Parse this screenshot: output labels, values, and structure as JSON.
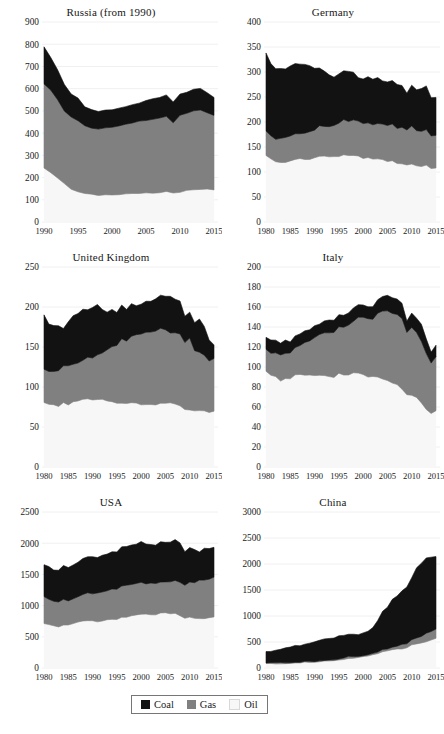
{
  "figure": {
    "type": "small-multiples",
    "panel_count": 6,
    "series_names": [
      "Coal",
      "Gas",
      "Oil"
    ],
    "colors": {
      "coal": "#121212",
      "gas": "#808080",
      "oil": "#f7f7f7",
      "axis": "#191919",
      "grid": "#f0f0f0"
    }
  },
  "legend": {
    "name": "chart-legend",
    "items": [
      {
        "label": "Coal",
        "color": "#121212"
      },
      {
        "label": "Gas",
        "color": "#808080"
      },
      {
        "label": "Oil",
        "color": "#f7f7f7"
      }
    ]
  },
  "chart_data": [
    {
      "type": "area",
      "stacked": true,
      "title": "Russia (from 1990)",
      "xlabel": "",
      "ylabel": "",
      "xlim": [
        1990,
        2015
      ],
      "ylim": [
        0,
        900
      ],
      "yticks": [
        0,
        100,
        200,
        300,
        400,
        500,
        600,
        700,
        800,
        900
      ],
      "xticks": [
        1990,
        1995,
        2000,
        2005,
        2010,
        2015
      ],
      "grid": true,
      "legend_position": "figure-bottom",
      "x": [
        1990,
        1991,
        1992,
        1993,
        1994,
        1995,
        1996,
        1997,
        1998,
        1999,
        2000,
        2001,
        2002,
        2003,
        2004,
        2005,
        2006,
        2007,
        2008,
        2009,
        2010,
        2011,
        2012,
        2013,
        2014,
        2015
      ],
      "series": [
        {
          "name": "Oil",
          "values": [
            240,
            224,
            200,
            170,
            150,
            138,
            128,
            124,
            120,
            122,
            123,
            124,
            126,
            128,
            130,
            131,
            132,
            134,
            135,
            130,
            136,
            140,
            144,
            146,
            146,
            143
          ]
        },
        {
          "name": "Gas",
          "values": [
            382,
            368,
            352,
            330,
            322,
            318,
            304,
            300,
            298,
            300,
            304,
            306,
            312,
            318,
            322,
            328,
            332,
            336,
            340,
            318,
            346,
            352,
            356,
            356,
            344,
            336
          ]
        },
        {
          "name": "Coal",
          "values": [
            170,
            152,
            136,
            120,
            108,
            100,
            90,
            84,
            80,
            80,
            82,
            84,
            84,
            86,
            88,
            90,
            92,
            92,
            96,
            88,
            92,
            94,
            96,
            98,
            92,
            86
          ]
        }
      ],
      "totals_note": "top of stack ~790 in 1990 falling to ~565 by 2015"
    },
    {
      "type": "area",
      "stacked": true,
      "title": "Germany",
      "xlabel": "",
      "ylabel": "",
      "xlim": [
        1980,
        2015
      ],
      "ylim": [
        0,
        400
      ],
      "yticks": [
        0,
        50,
        100,
        150,
        200,
        250,
        300,
        350,
        400
      ],
      "xticks": [
        1980,
        1985,
        1990,
        1995,
        2000,
        2005,
        2010,
        2015
      ],
      "grid": true,
      "legend_position": "figure-bottom",
      "x": [
        1980,
        1981,
        1982,
        1983,
        1984,
        1985,
        1986,
        1987,
        1988,
        1989,
        1990,
        1991,
        1992,
        1993,
        1994,
        1995,
        1996,
        1997,
        1998,
        1999,
        2000,
        2001,
        2002,
        2003,
        2004,
        2005,
        2006,
        2007,
        2008,
        2009,
        2010,
        2011,
        2012,
        2013,
        2014,
        2015
      ],
      "series": [
        {
          "name": "Oil",
          "values": [
            134,
            126,
            120,
            120,
            120,
            122,
            126,
            126,
            126,
            126,
            128,
            132,
            132,
            130,
            130,
            132,
            134,
            132,
            134,
            132,
            128,
            128,
            126,
            126,
            124,
            122,
            122,
            116,
            116,
            114,
            116,
            112,
            112,
            114,
            108,
            108
          ]
        },
        {
          "name": "Gas",
          "values": [
            48,
            46,
            46,
            47,
            48,
            50,
            50,
            50,
            52,
            54,
            56,
            60,
            58,
            60,
            62,
            66,
            70,
            68,
            70,
            70,
            68,
            70,
            68,
            72,
            72,
            72,
            74,
            72,
            74,
            70,
            76,
            70,
            70,
            72,
            64,
            66
          ]
        },
        {
          "name": "Coal",
          "values": [
            158,
            146,
            140,
            140,
            140,
            142,
            140,
            138,
            136,
            132,
            124,
            116,
            110,
            104,
            100,
            98,
            100,
            100,
            94,
            88,
            90,
            92,
            90,
            90,
            88,
            86,
            88,
            88,
            84,
            76,
            82,
            82,
            86,
            86,
            78,
            76
          ]
        }
      ],
      "totals_note": "~340 in 1980 declining to ~250 by 2015"
    },
    {
      "type": "area",
      "stacked": true,
      "title": "United Kingdom",
      "xlabel": "",
      "ylabel": "",
      "xlim": [
        1980,
        2015
      ],
      "ylim": [
        0,
        250
      ],
      "yticks": [
        0,
        50,
        100,
        150,
        200,
        250
      ],
      "xticks": [
        1980,
        1985,
        1990,
        1995,
        2000,
        2005,
        2010,
        2015
      ],
      "grid": true,
      "legend_position": "figure-bottom",
      "x": [
        1980,
        1981,
        1982,
        1983,
        1984,
        1985,
        1986,
        1987,
        1988,
        1989,
        1990,
        1991,
        1992,
        1993,
        1994,
        1995,
        1996,
        1997,
        1998,
        1999,
        2000,
        2001,
        2002,
        2003,
        2004,
        2005,
        2006,
        2007,
        2008,
        2009,
        2010,
        2011,
        2012,
        2013,
        2014,
        2015
      ],
      "series": [
        {
          "name": "Oil",
          "values": [
            80,
            78,
            78,
            76,
            80,
            78,
            82,
            82,
            84,
            86,
            84,
            84,
            84,
            82,
            82,
            80,
            80,
            80,
            80,
            80,
            78,
            78,
            78,
            78,
            80,
            80,
            80,
            78,
            76,
            72,
            72,
            70,
            70,
            70,
            68,
            70
          ]
        },
        {
          "name": "Gas",
          "values": [
            42,
            42,
            42,
            44,
            46,
            48,
            46,
            48,
            50,
            52,
            52,
            56,
            58,
            64,
            68,
            72,
            80,
            78,
            84,
            86,
            88,
            90,
            90,
            92,
            94,
            92,
            88,
            90,
            90,
            84,
            90,
            76,
            74,
            70,
            64,
            66
          ]
        },
        {
          "name": "Coal",
          "values": [
            68,
            60,
            58,
            58,
            48,
            54,
            62,
            62,
            62,
            60,
            64,
            62,
            56,
            48,
            46,
            42,
            42,
            40,
            40,
            36,
            38,
            40,
            38,
            40,
            40,
            42,
            44,
            42,
            40,
            32,
            32,
            34,
            42,
            36,
            28,
            18
          ]
        }
      ],
      "totals_note": "peak ~205 around 2000-2005, falling to ~150 by 2015"
    },
    {
      "type": "area",
      "stacked": true,
      "title": "Italy",
      "xlabel": "",
      "ylabel": "",
      "xlim": [
        1980,
        2015
      ],
      "ylim": [
        0,
        200
      ],
      "yticks": [
        0,
        20,
        40,
        60,
        80,
        100,
        120,
        140,
        160,
        180,
        200
      ],
      "xticks": [
        1980,
        1985,
        1990,
        1995,
        2000,
        2005,
        2010,
        2015
      ],
      "grid": true,
      "legend_position": "figure-bottom",
      "x": [
        1980,
        1981,
        1982,
        1983,
        1984,
        1985,
        1986,
        1987,
        1988,
        1989,
        1990,
        1991,
        1992,
        1993,
        1994,
        1995,
        1996,
        1997,
        1998,
        1999,
        2000,
        2001,
        2002,
        2003,
        2004,
        2005,
        2006,
        2007,
        2008,
        2009,
        2010,
        2011,
        2012,
        2013,
        2014,
        2015
      ],
      "series": [
        {
          "name": "Oil",
          "values": [
            96,
            92,
            90,
            86,
            88,
            88,
            92,
            92,
            92,
            92,
            92,
            92,
            92,
            90,
            90,
            94,
            92,
            92,
            94,
            94,
            92,
            90,
            90,
            90,
            88,
            86,
            84,
            82,
            78,
            72,
            72,
            70,
            64,
            58,
            54,
            56
          ]
        },
        {
          "name": "Gas",
          "values": [
            22,
            22,
            24,
            26,
            26,
            26,
            28,
            30,
            32,
            34,
            38,
            40,
            42,
            44,
            44,
            46,
            48,
            50,
            52,
            56,
            58,
            58,
            58,
            64,
            68,
            70,
            70,
            70,
            70,
            62,
            68,
            64,
            62,
            56,
            50,
            54
          ]
        },
        {
          "name": "Coal",
          "values": [
            12,
            12,
            12,
            12,
            12,
            12,
            12,
            12,
            12,
            12,
            12,
            12,
            12,
            12,
            12,
            12,
            12,
            12,
            12,
            12,
            12,
            12,
            12,
            14,
            14,
            16,
            16,
            16,
            16,
            12,
            14,
            14,
            16,
            14,
            12,
            12
          ]
        }
      ],
      "totals_note": "peak ~172 around 2005, dropping to ~120 by 2015"
    },
    {
      "type": "area",
      "stacked": true,
      "title": "USA",
      "xlabel": "",
      "ylabel": "",
      "xlim": [
        1980,
        2015
      ],
      "ylim": [
        0,
        2500
      ],
      "yticks": [
        0,
        500,
        1000,
        1500,
        2000,
        2500
      ],
      "xticks": [
        1980,
        1985,
        1990,
        1995,
        2000,
        2005,
        2010,
        2015
      ],
      "grid": true,
      "legend_position": "figure-bottom",
      "x": [
        1980,
        1981,
        1982,
        1983,
        1984,
        1985,
        1986,
        1987,
        1988,
        1989,
        1990,
        1991,
        1992,
        1993,
        1994,
        1995,
        1996,
        1997,
        1998,
        1999,
        2000,
        2001,
        2002,
        2003,
        2004,
        2005,
        2006,
        2007,
        2008,
        2009,
        2010,
        2011,
        2012,
        2013,
        2014,
        2015
      ],
      "series": [
        {
          "name": "Oil",
          "values": [
            720,
            690,
            670,
            665,
            690,
            690,
            715,
            730,
            760,
            765,
            755,
            745,
            760,
            765,
            785,
            785,
            805,
            820,
            840,
            860,
            865,
            855,
            860,
            860,
            885,
            880,
            870,
            875,
            840,
            795,
            810,
            795,
            785,
            800,
            805,
            820
          ]
        },
        {
          "name": "Gas",
          "values": [
            420,
            415,
            400,
            390,
            405,
            395,
            390,
            405,
            425,
            440,
            440,
            450,
            460,
            470,
            475,
            485,
            505,
            500,
            495,
            495,
            510,
            490,
            510,
            495,
            500,
            500,
            510,
            535,
            540,
            540,
            565,
            580,
            615,
            610,
            625,
            640
          ]
        },
        {
          "name": "Coal",
          "values": [
            520,
            510,
            480,
            500,
            530,
            530,
            530,
            545,
            565,
            580,
            575,
            570,
            580,
            605,
            605,
            605,
            630,
            640,
            645,
            630,
            650,
            630,
            620,
            630,
            635,
            645,
            630,
            630,
            615,
            540,
            570,
            530,
            475,
            500,
            495,
            455
          ]
        }
      ],
      "totals_note": "peak ~2030 around 2005-2007, ~1915 by 2015"
    },
    {
      "type": "area",
      "stacked": true,
      "title": "China",
      "xlabel": "",
      "ylabel": "",
      "xlim": [
        1980,
        2015
      ],
      "ylim": [
        0,
        3000
      ],
      "yticks": [
        0,
        500,
        1000,
        1500,
        2000,
        2500,
        3000
      ],
      "xticks": [
        1980,
        1985,
        1990,
        1995,
        2000,
        2005,
        2010,
        2015
      ],
      "grid": true,
      "legend_position": "figure-bottom",
      "x": [
        1980,
        1981,
        1982,
        1983,
        1984,
        1985,
        1986,
        1987,
        1988,
        1989,
        1990,
        1991,
        1992,
        1993,
        1994,
        1995,
        1996,
        1997,
        1998,
        1999,
        2000,
        2001,
        2002,
        2003,
        2004,
        2005,
        2006,
        2007,
        2008,
        2009,
        2010,
        2011,
        2012,
        2013,
        2014,
        2015
      ],
      "series": [
        {
          "name": "Oil",
          "values": [
            85,
            85,
            85,
            88,
            92,
            95,
            100,
            105,
            112,
            115,
            113,
            122,
            130,
            145,
            145,
            160,
            172,
            196,
            192,
            205,
            224,
            228,
            247,
            271,
            319,
            327,
            350,
            368,
            375,
            389,
            437,
            461,
            484,
            507,
            527,
            560
          ]
        },
        {
          "name": "Gas",
          "values": [
            13,
            12,
            11,
            11,
            11,
            12,
            12,
            12,
            13,
            14,
            14,
            15,
            15,
            16,
            16,
            17,
            18,
            19,
            20,
            21,
            22,
            25,
            27,
            31,
            35,
            42,
            50,
            61,
            73,
            80,
            97,
            119,
            133,
            153,
            168,
            178
          ]
        },
        {
          "name": "Coal",
          "values": [
            210,
            215,
            230,
            245,
            270,
            295,
            310,
            330,
            350,
            365,
            370,
            380,
            395,
            410,
            430,
            455,
            450,
            440,
            425,
            430,
            450,
            470,
            520,
            620,
            720,
            810,
            900,
            980,
            1030,
            1090,
            1200,
            1350,
            1400,
            1450,
            1430,
            1400
          ]
        }
      ],
      "totals_note": "~310 in 1980 rising steeply after 2002 to ~2620 by 2015"
    }
  ]
}
